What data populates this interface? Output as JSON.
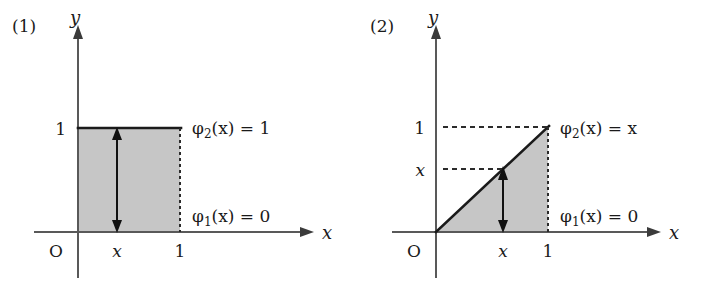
{
  "figure": {
    "panels": [
      {
        "tag": "(1)",
        "axes": {
          "x_label": "x",
          "y_label": "y",
          "origin_label": "O"
        },
        "x_ticks": [
          {
            "label": "x",
            "value": 0.42,
            "italic": true
          },
          {
            "label": "1",
            "value": 1.0,
            "italic": false
          }
        ],
        "y_ticks": [
          {
            "label": "1",
            "value": 1.0,
            "italic": false
          }
        ],
        "upper_curve": {
          "text_main": "φ",
          "text_sub": "2",
          "text_rest": "(x) = 1",
          "expression": "φ₂(x) = 1"
        },
        "lower_curve": {
          "text_main": "φ",
          "text_sub": "1",
          "text_rest": "(x) = 0",
          "expression": "φ₁(x) = 0"
        },
        "region": {
          "type": "rectangle",
          "x_from": 0,
          "x_to": 1,
          "y_from": 0,
          "y_to": 1,
          "fill_color": "#c6c6c6"
        },
        "measure_arrow": {
          "at_x": 0.42,
          "from_y": 0,
          "to_y": 1,
          "double_headed": true
        }
      },
      {
        "tag": "(2)",
        "axes": {
          "x_label": "x",
          "y_label": "y",
          "origin_label": "O"
        },
        "x_ticks": [
          {
            "label": "x",
            "value": 0.6,
            "italic": true
          },
          {
            "label": "1",
            "value": 1.0,
            "italic": false
          }
        ],
        "y_ticks": [
          {
            "label": "1",
            "value": 1.0,
            "italic": false
          },
          {
            "label": "x",
            "value": 0.6,
            "italic": true
          }
        ],
        "upper_curve": {
          "text_main": "φ",
          "text_sub": "2",
          "text_rest": "(x) = x",
          "expression": "φ₂(x) = x"
        },
        "lower_curve": {
          "text_main": "φ",
          "text_sub": "1",
          "text_rest": "(x) = 0",
          "expression": "φ₁(x) = 0"
        },
        "region": {
          "type": "triangle",
          "x_from": 0,
          "x_to": 1,
          "y_from": 0,
          "y_to": "x",
          "fill_color": "#c6c6c6"
        },
        "measure_arrow": {
          "at_x": 0.6,
          "from_y": 0,
          "to_y": 0.6,
          "double_headed": true
        }
      }
    ],
    "colors": {
      "shading": "#c6c6c6",
      "axis": "#595959",
      "curve": "#1a1a1a",
      "text": "#1a1a1a"
    }
  }
}
